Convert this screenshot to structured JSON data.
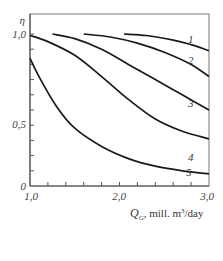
{
  "chart_data": {
    "type": "line",
    "title": "",
    "xlabel": "Q_G, mill. m^3/day",
    "ylabel": "η",
    "xlim": [
      1.0,
      3.0
    ],
    "ylim": [
      0,
      1.0
    ],
    "x_ticks": [
      "1,0",
      "2,0",
      "3,0"
    ],
    "y_ticks": [
      "0",
      "0,5",
      "1,0"
    ],
    "grid": false,
    "legend": "inline curve labels 1-5",
    "series": [
      {
        "name": "1",
        "x": [
          2.05,
          2.3,
          2.6,
          2.8,
          3.0
        ],
        "y": [
          1.0,
          0.99,
          0.96,
          0.93,
          0.89
        ]
      },
      {
        "name": "2",
        "x": [
          1.6,
          1.9,
          2.2,
          2.5,
          2.8,
          3.0
        ],
        "y": [
          1.0,
          0.98,
          0.94,
          0.88,
          0.8,
          0.72
        ]
      },
      {
        "name": "3",
        "x": [
          1.25,
          1.5,
          1.8,
          2.1,
          2.4,
          2.7,
          3.0
        ],
        "y": [
          1.0,
          0.97,
          0.9,
          0.8,
          0.7,
          0.6,
          0.5
        ]
      },
      {
        "name": "4",
        "x": [
          1.0,
          1.2,
          1.5,
          1.8,
          2.1,
          2.4,
          2.7,
          3.0
        ],
        "y": [
          0.99,
          0.95,
          0.86,
          0.72,
          0.57,
          0.44,
          0.36,
          0.31
        ]
      },
      {
        "name": "5",
        "x": [
          1.0,
          1.1,
          1.3,
          1.5,
          1.8,
          2.1,
          2.4,
          2.7,
          3.0
        ],
        "y": [
          0.84,
          0.72,
          0.52,
          0.38,
          0.26,
          0.18,
          0.13,
          0.1,
          0.08
        ]
      }
    ]
  },
  "labels": {
    "y_axis_symbol": "η",
    "x_axis_symbol": "Q",
    "x_axis_subscript": "G",
    "x_axis_units": ", mill. m",
    "x_axis_units_sup": "3",
    "x_axis_units_tail": "/day",
    "tick_y_0": "0",
    "tick_y_05": "0,5",
    "tick_y_1": "1,0",
    "tick_x_1": "1,0",
    "tick_x_2": "2,0",
    "tick_x_3": "3,0",
    "curve_1": "1",
    "curve_2": "2",
    "curve_3": "3",
    "curve_4": "4",
    "curve_5": "5"
  }
}
